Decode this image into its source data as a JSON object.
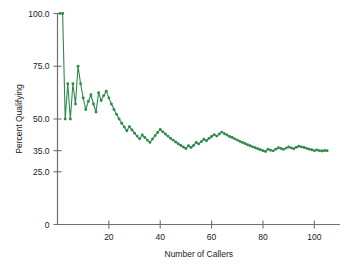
{
  "chart_data": {
    "type": "line",
    "title": "",
    "xlabel": "Number of Callers",
    "ylabel": "Percent Qualifying",
    "xlim": [
      0,
      110
    ],
    "ylim": [
      0,
      100
    ],
    "grid": false,
    "legend": null,
    "series_color": "#2E8B4A",
    "axis_color": "#6F6F6F",
    "marker": "circle",
    "xticks": [
      20,
      40,
      60,
      80,
      100
    ],
    "xtick_labels": [
      "20",
      "40",
      "60",
      "80",
      "100"
    ],
    "yticks": [
      0,
      25,
      35,
      50,
      75,
      100
    ],
    "ytick_labels": [
      "0",
      "25.0",
      "35.0",
      "50.0",
      "75.0",
      "100.0"
    ],
    "series": [
      {
        "name": "Percent Qualifying",
        "x": [
          1,
          2,
          3,
          4,
          5,
          6,
          7,
          8,
          9,
          10,
          11,
          12,
          13,
          14,
          15,
          16,
          17,
          18,
          19,
          20,
          21,
          22,
          23,
          24,
          25,
          26,
          27,
          28,
          29,
          30,
          31,
          32,
          33,
          34,
          35,
          36,
          37,
          38,
          39,
          40,
          41,
          42,
          43,
          44,
          45,
          46,
          47,
          48,
          49,
          50,
          51,
          52,
          53,
          54,
          55,
          56,
          57,
          58,
          59,
          60,
          61,
          62,
          63,
          64,
          65,
          66,
          67,
          68,
          69,
          70,
          71,
          72,
          73,
          74,
          75,
          76,
          77,
          78,
          79,
          80,
          81,
          82,
          83,
          84,
          85,
          86,
          87,
          88,
          89,
          90,
          91,
          92,
          93,
          94,
          95,
          96,
          97,
          98,
          99,
          100,
          101,
          102,
          103,
          104,
          105
        ],
        "values": [
          100.0,
          100.0,
          50.0,
          66.7,
          50.0,
          66.7,
          57.1,
          75.0,
          66.7,
          60.0,
          54.5,
          58.3,
          61.5,
          57.1,
          53.3,
          62.5,
          58.8,
          61.1,
          63.2,
          60.0,
          57.1,
          54.5,
          52.2,
          50.0,
          48.0,
          46.2,
          44.4,
          46.4,
          44.8,
          43.3,
          41.9,
          40.6,
          42.4,
          41.2,
          40.0,
          38.9,
          40.5,
          42.1,
          43.6,
          45.0,
          43.9,
          42.9,
          41.9,
          40.9,
          40.0,
          39.1,
          38.3,
          37.5,
          36.7,
          36.0,
          37.3,
          36.5,
          37.5,
          38.9,
          38.2,
          39.3,
          40.4,
          39.7,
          40.8,
          41.7,
          42.6,
          41.9,
          42.9,
          43.8,
          43.0,
          42.4,
          41.7,
          41.2,
          40.6,
          40.0,
          39.4,
          38.9,
          38.4,
          37.8,
          37.3,
          36.8,
          36.4,
          35.9,
          35.4,
          35.0,
          34.6,
          35.7,
          35.2,
          34.9,
          35.7,
          36.4,
          36.0,
          35.6,
          36.2,
          36.7,
          36.3,
          35.9,
          36.6,
          37.1,
          36.8,
          36.5,
          36.1,
          35.7,
          35.4,
          35.0,
          35.3,
          35.0,
          34.8,
          35.1,
          35.0
        ]
      }
    ]
  }
}
